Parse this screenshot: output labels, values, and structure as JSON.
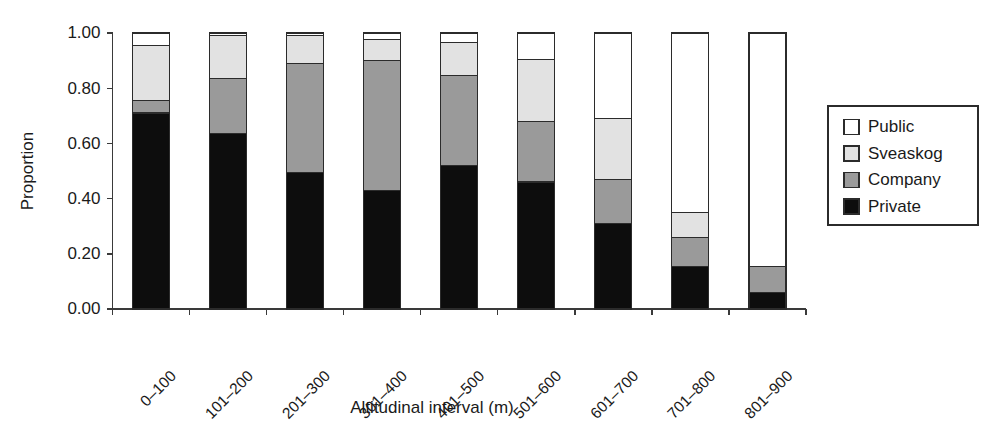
{
  "chart_data": {
    "type": "bar",
    "subtype": "stacked-bar-proportional",
    "title": "",
    "xlabel": "Altitudinal interval (m)",
    "ylabel": "Proportion",
    "categories": [
      "0–100",
      "101–200",
      "201–300",
      "301–400",
      "401–500",
      "501–600",
      "601–700",
      "701–800",
      "801–900"
    ],
    "ylim": [
      0.0,
      1.0
    ],
    "yticks": [
      0.0,
      0.2,
      0.4,
      0.6,
      0.8,
      1.0
    ],
    "ytick_labels": [
      "0.00",
      "0.20",
      "0.40",
      "0.60",
      "0.80",
      "1.00"
    ],
    "grid": false,
    "legend_position": "right",
    "stack_order_bottom_to_top": [
      "Private",
      "Company",
      "Sveaskog",
      "Public"
    ],
    "series": [
      {
        "name": "Private",
        "color": "#0d0d0d",
        "values": [
          0.71,
          0.635,
          0.495,
          0.43,
          0.52,
          0.46,
          0.31,
          0.155,
          0.06
        ]
      },
      {
        "name": "Company",
        "color": "#9a9a9a",
        "values": [
          0.045,
          0.2,
          0.395,
          0.47,
          0.325,
          0.22,
          0.16,
          0.105,
          0.095
        ]
      },
      {
        "name": "Sveaskog",
        "color": "#e2e2e2",
        "values": [
          0.2,
          0.155,
          0.1,
          0.075,
          0.12,
          0.225,
          0.22,
          0.09,
          0.0
        ]
      },
      {
        "name": "Public",
        "color": "#ffffff",
        "values": [
          0.045,
          0.01,
          0.01,
          0.025,
          0.035,
          0.095,
          0.31,
          0.65,
          0.845
        ]
      }
    ]
  },
  "legend": {
    "entries": [
      {
        "label": "Public",
        "color": "#ffffff"
      },
      {
        "label": "Sveaskog",
        "color": "#e2e2e2"
      },
      {
        "label": "Company",
        "color": "#9a9a9a"
      },
      {
        "label": "Private",
        "color": "#0d0d0d"
      }
    ]
  }
}
